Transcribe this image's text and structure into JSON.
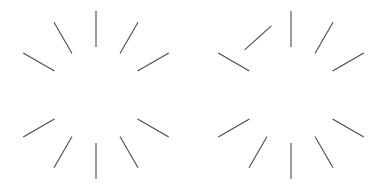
{
  "canvas": {
    "width": 389,
    "height": 186,
    "background_color": "#ffffff"
  },
  "style": {
    "stroke_color": "#4a4a4a",
    "stroke_width": 1.1,
    "line_cap": "butt"
  },
  "figures": [
    {
      "id": "left-figure",
      "name": "radial-tick-burst-left",
      "center_x": 96,
      "center_y": 95,
      "inner_radius": 48,
      "outer_radius": 84,
      "tick_count": 10,
      "all_radial": true,
      "ticks": [
        {
          "name": "tick-12-oclock",
          "clock": 12,
          "angle_deg": -90,
          "rotation_offset_deg": 0
        },
        {
          "name": "tick-1-oclock",
          "clock": 1,
          "angle_deg": -60,
          "rotation_offset_deg": 0
        },
        {
          "name": "tick-2-oclock",
          "clock": 2,
          "angle_deg": -30,
          "rotation_offset_deg": 0
        },
        {
          "name": "tick-4-oclock",
          "clock": 4,
          "angle_deg": 30,
          "rotation_offset_deg": 0
        },
        {
          "name": "tick-5-oclock",
          "clock": 5,
          "angle_deg": 60,
          "rotation_offset_deg": 0
        },
        {
          "name": "tick-6-oclock",
          "clock": 6,
          "angle_deg": 90,
          "rotation_offset_deg": 0
        },
        {
          "name": "tick-7-oclock",
          "clock": 7,
          "angle_deg": 120,
          "rotation_offset_deg": 0
        },
        {
          "name": "tick-8-oclock",
          "clock": 8,
          "angle_deg": 150,
          "rotation_offset_deg": 0
        },
        {
          "name": "tick-10-oclock",
          "clock": 10,
          "angle_deg": -150,
          "rotation_offset_deg": 0
        },
        {
          "name": "tick-11-oclock",
          "clock": 11,
          "angle_deg": -120,
          "rotation_offset_deg": 0
        }
      ]
    },
    {
      "id": "right-figure",
      "name": "radial-tick-burst-right",
      "center_x": 291,
      "center_y": 95,
      "inner_radius": 48,
      "outer_radius": 84,
      "tick_count": 10,
      "all_radial": false,
      "ticks": [
        {
          "name": "tick-12-oclock",
          "clock": 12,
          "angle_deg": -90,
          "rotation_offset_deg": 0
        },
        {
          "name": "tick-1-oclock",
          "clock": 1,
          "angle_deg": -60,
          "rotation_offset_deg": 0
        },
        {
          "name": "tick-2-oclock",
          "clock": 2,
          "angle_deg": -30,
          "rotation_offset_deg": 0
        },
        {
          "name": "tick-4-oclock",
          "clock": 4,
          "angle_deg": 30,
          "rotation_offset_deg": 0
        },
        {
          "name": "tick-5-oclock",
          "clock": 5,
          "angle_deg": 60,
          "rotation_offset_deg": 0
        },
        {
          "name": "tick-6-oclock",
          "clock": 6,
          "angle_deg": 90,
          "rotation_offset_deg": 0
        },
        {
          "name": "tick-7-oclock",
          "clock": 7,
          "angle_deg": 120,
          "rotation_offset_deg": 0
        },
        {
          "name": "tick-8-oclock",
          "clock": 8,
          "angle_deg": 150,
          "rotation_offset_deg": 0
        },
        {
          "name": "tick-10-oclock",
          "clock": 10,
          "angle_deg": -150,
          "rotation_offset_deg": 0
        },
        {
          "name": "tick-11-oclock-rotated",
          "clock": 11,
          "angle_deg": -120,
          "rotation_offset_deg": 78
        }
      ]
    }
  ]
}
